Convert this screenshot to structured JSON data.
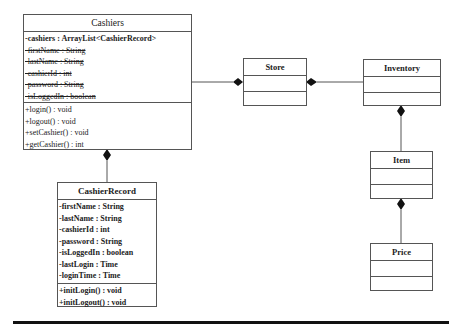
{
  "classes": {
    "cashiers": {
      "name": "Cashiers",
      "attributes": [
        {
          "text": "-cashiers : ArrayList<CashierRecord>",
          "style": "bold"
        },
        {
          "text": "-firstName : String",
          "style": "strike"
        },
        {
          "text": "-lastName : String",
          "style": "strike"
        },
        {
          "text": "-cashierId : int",
          "style": "strike"
        },
        {
          "text": "-password : String",
          "style": "strike"
        },
        {
          "text": "-isLoggedIn : boolean",
          "style": "strike"
        }
      ],
      "methods": [
        {
          "text": "+login() : void"
        },
        {
          "text": "+logout() : void"
        },
        {
          "text": "+setCashier() : void"
        },
        {
          "text": "+getCashier() : int"
        }
      ]
    },
    "cashier_record": {
      "name": "CashierRecord",
      "attributes": [
        {
          "text": "-firstName : String"
        },
        {
          "text": "-lastName : String"
        },
        {
          "text": "-cashierId : int"
        },
        {
          "text": "-password : String"
        },
        {
          "text": "-isLoggedIn : boolean"
        },
        {
          "text": "-lastLogin : Time"
        },
        {
          "text": "-loginTime : Time"
        }
      ],
      "methods": [
        {
          "text": "+initLogin() : void"
        },
        {
          "text": "+initLogout() : void"
        }
      ]
    },
    "store": {
      "name": "Store",
      "attributes": [],
      "methods": []
    },
    "inventory": {
      "name": "Inventory",
      "attributes": [],
      "methods": []
    },
    "item": {
      "name": "Item",
      "attributes": [],
      "methods": []
    },
    "price": {
      "name": "Price",
      "attributes": [],
      "methods": []
    }
  },
  "relationships": [
    {
      "from": "Store",
      "to": "Cashiers",
      "type": "composition",
      "diamond_at": "Store"
    },
    {
      "from": "Store",
      "to": "Inventory",
      "type": "composition",
      "diamond_at": "Store"
    },
    {
      "from": "Cashiers",
      "to": "CashierRecord",
      "type": "composition",
      "diamond_at": "Cashiers"
    },
    {
      "from": "Inventory",
      "to": "Item",
      "type": "composition",
      "diamond_at": "Inventory"
    },
    {
      "from": "Item",
      "to": "Price",
      "type": "composition",
      "diamond_at": "Item"
    }
  ],
  "colors": {
    "line": "#555555",
    "rule": "#111111",
    "text": "#222222"
  }
}
